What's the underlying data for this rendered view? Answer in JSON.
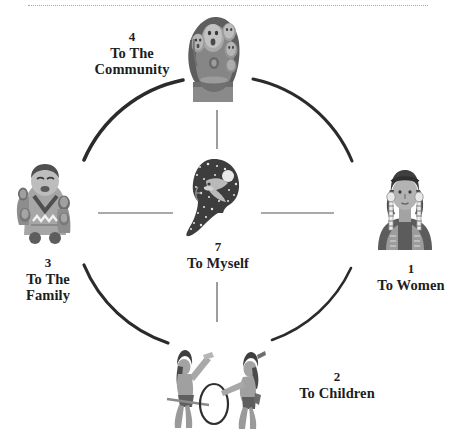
{
  "page": {
    "background_color": "#ffffff",
    "top_rule_color": "#9a9a9a"
  },
  "diagram": {
    "type": "circle-relationship-wheel",
    "center": {
      "id": "myself",
      "number": "7",
      "line1": "To Myself",
      "line2": "",
      "artwork_name": "profile-head-with-stars-artwork"
    },
    "nodes": [
      {
        "id": "women",
        "number": "1",
        "line1": "To Women",
        "line2": "",
        "position": "right",
        "artwork_name": "native-woman-portrait-artwork"
      },
      {
        "id": "children",
        "number": "2",
        "line1": "To Children",
        "line2": "",
        "position": "bottom",
        "artwork_name": "children-playing-hoop-artwork"
      },
      {
        "id": "family",
        "number": "3",
        "line1": "To The",
        "line2": "Family",
        "position": "left",
        "artwork_name": "storyteller-figurine-artwork"
      },
      {
        "id": "community",
        "number": "4",
        "line1": "To The",
        "line2": "Community",
        "position": "top",
        "artwork_name": "community-group-faces-artwork"
      }
    ]
  },
  "colors": {
    "ink": "#1d1d1d",
    "arc": "#2b2b2b",
    "spoke": "#8c8c8c",
    "art_dark": "#4a4a4a",
    "art_mid": "#7d7d7d",
    "art_light": "#b4b4b4",
    "art_pale": "#d6d6d6"
  }
}
